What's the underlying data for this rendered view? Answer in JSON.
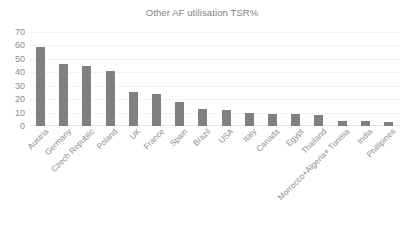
{
  "chart_data": {
    "type": "bar",
    "title": "Other AF utilisation TSR%",
    "xlabel": "",
    "ylabel": "",
    "ylim": [
      0,
      70
    ],
    "yticks": [
      0,
      10,
      20,
      30,
      40,
      50,
      60,
      70
    ],
    "grid": true,
    "legend": "none",
    "bar_color": "#808080",
    "categories": [
      "Austria",
      "Germany",
      "Czech Republic",
      "Poland",
      "UK",
      "France",
      "Spain",
      "Brazil",
      "USA",
      "Italy",
      "Canada",
      "Egypt",
      "Thailand",
      "Morrocco+Algeria+ Tunisia",
      "India",
      "Phillipines"
    ],
    "values": [
      59,
      46.5,
      45,
      41,
      25.5,
      23.5,
      18,
      13,
      11.8,
      10,
      9,
      9,
      8.5,
      4,
      3.5,
      3.3
    ]
  }
}
